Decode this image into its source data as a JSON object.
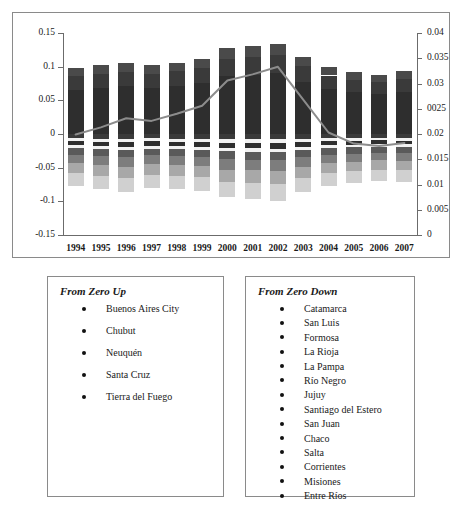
{
  "chart_data": {
    "type": "bar",
    "title": "",
    "xlabel": "",
    "ylabel": "",
    "grid": false,
    "legend_position": "below-chart",
    "categories": [
      "1994",
      "1995",
      "1996",
      "1997",
      "1998",
      "1999",
      "2000",
      "2001",
      "2002",
      "2003",
      "2004",
      "2005",
      "2006",
      "2007"
    ],
    "left_axis": {
      "label": "",
      "ylim": [
        -0.15,
        0.15
      ],
      "ticks": [
        "0.15",
        "0.1",
        "0.05",
        "0",
        "-0.05",
        "-0.1",
        "-0.15"
      ],
      "tick_values": [
        0.15,
        0.1,
        0.05,
        0,
        -0.05,
        -0.1,
        -0.15
      ]
    },
    "right_axis": {
      "label": "",
      "ylim": [
        0,
        0.04
      ],
      "ticks": [
        "0.04",
        "0.035",
        "0.03",
        "0025",
        "0.02",
        "0.015",
        "0.01",
        "0.005",
        "0"
      ],
      "tick_values": [
        0.04,
        0.035,
        0.03,
        0.025,
        0.02,
        0.015,
        0.01,
        0.005,
        0
      ]
    },
    "series": [
      {
        "name": "From Zero Up (stacked positive)",
        "axis": "left",
        "type": "stacked-bar",
        "values": [
          0.098,
          0.102,
          0.105,
          0.102,
          0.106,
          0.112,
          0.127,
          0.131,
          0.134,
          0.115,
          0.099,
          0.092,
          0.088,
          0.093
        ]
      },
      {
        "name": "From Zero Down (stacked negative)",
        "axis": "left",
        "type": "stacked-bar",
        "values": [
          -0.077,
          -0.082,
          -0.086,
          -0.08,
          -0.082,
          -0.085,
          -0.094,
          -0.096,
          -0.099,
          -0.086,
          -0.077,
          -0.073,
          -0.07,
          -0.071
        ]
      },
      {
        "name": "Line series",
        "axis": "right",
        "type": "line",
        "color": "#8c8c8c",
        "values": [
          0.0199,
          0.0213,
          0.0231,
          0.0226,
          0.024,
          0.0256,
          0.0306,
          0.0318,
          0.0333,
          0.0268,
          0.0203,
          0.0181,
          0.0176,
          0.0182
        ]
      }
    ],
    "bar_positive_segments": [
      0.012,
      0.02,
      0.066
    ],
    "bar_negative_segments": [
      0.006,
      0.004,
      0.006,
      0.004,
      0.009,
      0.012,
      0.014,
      0.018
    ],
    "bar_positive_colors": [
      "#4a4a4a",
      "#3a3a3a",
      "#2e2e2e"
    ],
    "bar_negative_colors": [
      "#3a3a3a",
      "#f2f2f2",
      "#2e2e2e",
      "#f2f2f2",
      "#5a5a5a",
      "#7d7d7d",
      "#a8a8a8",
      "#d0d0d0"
    ]
  },
  "legends": {
    "up": {
      "title": "From Zero Up",
      "items": [
        "Buenos Aires City",
        "Chubut",
        "Neuquén",
        "Santa Cruz",
        "Tierra del Fuego"
      ]
    },
    "down": {
      "title": "From Zero Down",
      "items": [
        "Catamarca",
        "San Luis",
        "Formosa",
        "La Rioja",
        "La Pampa",
        "Río Negro",
        "Jujuy",
        "Santiago del Estero",
        "San Juan",
        "Chaco",
        "Salta",
        "Corrientes",
        "Misiones",
        "Entre Ríos"
      ]
    }
  }
}
